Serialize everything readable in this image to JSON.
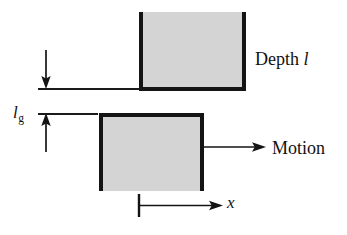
{
  "figure": {
    "type": "physics-schematic",
    "background_color": "#ffffff",
    "block_fill_color": "#d4d4d4",
    "stroke_color": "#141414"
  },
  "blocks": [
    {
      "name": "upper-block",
      "open_side": "top",
      "x": 139,
      "y": 12,
      "width": 107,
      "height": 79
    },
    {
      "name": "lower-block",
      "open_side": "bottom",
      "x": 99,
      "y": 113,
      "width": 105,
      "height": 78
    }
  ],
  "reference_lines": [
    {
      "name": "upper-surface-line",
      "x": 38,
      "y": 88,
      "length": 102
    },
    {
      "name": "lower-surface-line",
      "x": 38,
      "y": 113,
      "length": 60
    }
  ],
  "arrows": [
    {
      "name": "depth-arrow",
      "direction": "down",
      "label_ref": "depth"
    },
    {
      "name": "gap-arrow",
      "direction": "up",
      "label_ref": "gap"
    },
    {
      "name": "motion-arrow",
      "direction": "right",
      "label_ref": "motion"
    },
    {
      "name": "x-axis-arrow",
      "direction": "right",
      "label_ref": "x_axis"
    }
  ],
  "labels": {
    "depth": {
      "text": "Depth",
      "symbol": "l",
      "symbol_style": "italic",
      "full": "Depth l"
    },
    "gap": {
      "symbol": "l",
      "subscript": "g",
      "symbol_style": "italic",
      "full": "l_g"
    },
    "motion": {
      "text": "Motion"
    },
    "x_axis": {
      "symbol": "x",
      "symbol_style": "italic"
    }
  }
}
